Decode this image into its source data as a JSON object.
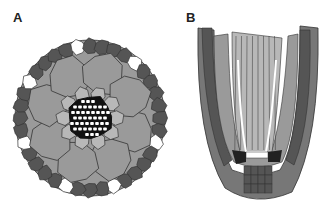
{
  "figure": {
    "panels": [
      {
        "label": "A",
        "description": "Root transverse section"
      },
      {
        "label": "B",
        "description": "Root longitudinal section"
      }
    ],
    "colors": {
      "outer_cell": "#555555",
      "cortex_cell": "#9a9a9a",
      "inner_cell": "#b8b8b8",
      "stele_dark": "#111111",
      "cell_white": "#ffffff",
      "cell_stroke": "#333333",
      "cap_cell": "#777777",
      "dark_initial": "#222222"
    }
  }
}
